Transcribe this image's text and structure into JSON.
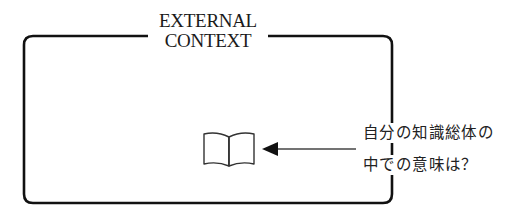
{
  "diagram": {
    "container": {
      "label_lines": [
        "EXTERNAL",
        "CONTEXT"
      ]
    },
    "icon": "open-book-icon",
    "annotation": {
      "lines": [
        "自分の知識総体の",
        "中での意味は？"
      ]
    },
    "colors": {
      "stroke": "#111111",
      "arrow": "#333333",
      "text": "#1a1a1a",
      "background": "#ffffff"
    }
  }
}
